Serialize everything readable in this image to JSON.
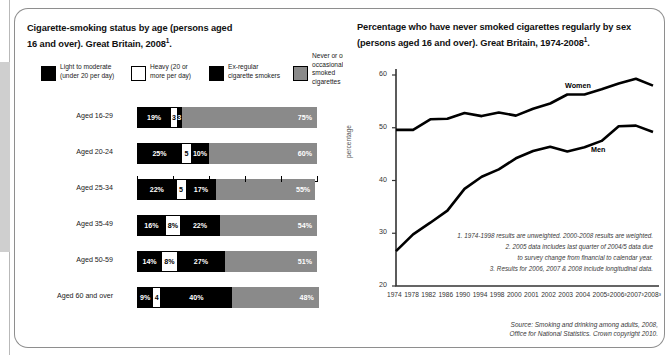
{
  "left_panel": {
    "title_line1": "Cigarette-smoking status by age (persons aged",
    "title_line2": "16 and over). Great Britain, 2008",
    "title_sup": "1",
    "title_end": ".",
    "legend": [
      {
        "swatch": "black",
        "line1": "Light to moderate",
        "line2": "(under 20 per day)"
      },
      {
        "swatch": "white",
        "line1": "Heavy (20 or",
        "line2": "more per day)"
      },
      {
        "swatch": "black",
        "line1": "Ex-regular",
        "line2": "cigarette smokers"
      },
      {
        "swatch": "grey",
        "line1": "Never or only",
        "line2": "occasionally",
        "line3": "smoked",
        "line4": "cigarettes"
      }
    ],
    "axis": {
      "pct_symbol": "%",
      "ticks": [
        "0",
        "20",
        "40",
        "60",
        "80",
        "100"
      ]
    }
  },
  "right_panel": {
    "title_line1": "Percentage who have never smoked cigarettes regularly by sex",
    "title_line2": "(persons aged 16 and over). Great Britain, 1974-2008",
    "title_sup": "1",
    "title_end": ".",
    "ylabel": "percentage",
    "series_labels": {
      "women": "Women",
      "men": "Men"
    },
    "notes": [
      "1. 1974-1998 results are unweighted. 2000-2008 results are weighted.",
      "2. 2005 data includes last quarter of 2004/5 data due",
      "to survey change from financial to calendar year.",
      "3. Results for 2006, 2007 & 2008 include longitudinal data."
    ]
  },
  "source": {
    "line1": "Source: Smoking and drinking among adults, 2008,",
    "line2": "Office for National Statistics. Crown copyright 2010."
  },
  "colors": {
    "light_to_moderate": "#000000",
    "heavy": "#ffffff",
    "ex_regular": "#000000",
    "never_or_occasional": "#8a8a8a",
    "panel_border": "#8e8e8e",
    "text": "#1a1a1a"
  },
  "chart_data": [
    {
      "type": "bar",
      "orientation": "horizontal",
      "stacked": true,
      "title": "Cigarette-smoking status by age (persons aged 16 and over). Great Britain, 2008",
      "xlabel": "%",
      "ylabel": "",
      "xlim": [
        0,
        100
      ],
      "xticks": [
        0,
        20,
        40,
        60,
        80,
        100
      ],
      "grid": false,
      "legend_position": "top",
      "categories": [
        "Aged 16-29",
        "Aged 20-24",
        "Aged 25-34",
        "Aged 35-49",
        "Aged 50-59",
        "Aged 60 and over"
      ],
      "series": [
        {
          "name": "Light to moderate (under 20 per day)",
          "color": "#000000",
          "values": [
            19,
            25,
            22,
            16,
            14,
            9
          ],
          "labels": [
            "19%",
            "25%",
            "22%",
            "16%",
            "14%",
            "9%"
          ]
        },
        {
          "name": "Heavy (20 or more per day)",
          "color": "#ffffff",
          "values": [
            3,
            5,
            5,
            8,
            8,
            4
          ],
          "labels": [
            "3",
            "5",
            "5",
            "8%",
            "8%",
            "4"
          ]
        },
        {
          "name": "Ex-regular cigarette smokers",
          "color": "#000000",
          "values": [
            3,
            10,
            17,
            22,
            27,
            40
          ],
          "labels": [
            "3",
            "10%",
            "17%",
            "22%",
            "27%",
            "40%"
          ]
        },
        {
          "name": "Never or only occasionally smoked cigarettes",
          "color": "#8a8a8a",
          "values": [
            75,
            60,
            55,
            54,
            51,
            48
          ],
          "labels": [
            "75%",
            "60%",
            "55%",
            "54%",
            "51%",
            "48%"
          ]
        }
      ]
    },
    {
      "type": "line",
      "title": "Percentage who have never smoked cigarettes regularly by sex (persons aged 16 and over). Great Britain, 1974-2008",
      "xlabel": "",
      "ylabel": "percentage",
      "ylim": [
        20,
        60
      ],
      "yticks": [
        20,
        30,
        40,
        50,
        60
      ],
      "grid": false,
      "legend_position": "inline",
      "x": [
        "1974",
        "1978",
        "1982",
        "1986",
        "1990",
        "1994",
        "1998",
        "2000",
        "2001",
        "2002",
        "2003",
        "2004",
        "2005",
        "2006",
        "2007",
        "2008"
      ],
      "xtick_labels": [
        "1974",
        "1978",
        "1982",
        "1986",
        "1990",
        "1994",
        "1998",
        "2000",
        "2001",
        "2002",
        "2003",
        "2004",
        "2005²",
        "2006³",
        "2007³",
        "2008³"
      ],
      "series": [
        {
          "name": "Women",
          "color": "#000000",
          "values": [
            49.6,
            49.6,
            51.6,
            51.7,
            52.8,
            52.2,
            52.9,
            52.3,
            53.6,
            54.6,
            56.3,
            56.3,
            57.3,
            58.4,
            59.3,
            58.0
          ]
        },
        {
          "name": "Men",
          "color": "#000000",
          "values": [
            26.6,
            29.8,
            32.0,
            34.3,
            38.4,
            40.7,
            42.1,
            44.2,
            45.6,
            46.4,
            45.5,
            46.3,
            47.5,
            50.3,
            50.4,
            49.2
          ]
        }
      ]
    }
  ]
}
